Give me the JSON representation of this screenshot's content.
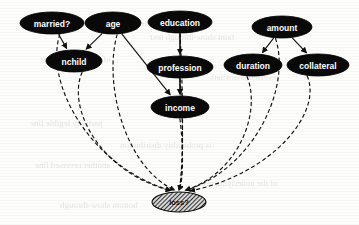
{
  "figure": {
    "type": "bayesian-network",
    "title_visible": false,
    "background": "#fdfdfb",
    "node_fill": "#090909",
    "node_text_color": "#ffffff",
    "target_node_fill": "hatched-gray",
    "edge_color": "#111111"
  },
  "nodes": [
    {
      "id": "married",
      "label": "married?",
      "cx": 52,
      "cy": 23,
      "rx": 32,
      "ry": 11,
      "style": "filled"
    },
    {
      "id": "age",
      "label": "age",
      "cx": 113,
      "cy": 23,
      "rx": 28,
      "ry": 11,
      "style": "filled"
    },
    {
      "id": "education",
      "label": "education",
      "cx": 180,
      "cy": 22,
      "rx": 32,
      "ry": 11,
      "style": "filled"
    },
    {
      "id": "amount",
      "label": "amount",
      "cx": 282,
      "cy": 27,
      "rx": 30,
      "ry": 11,
      "style": "filled"
    },
    {
      "id": "nchild",
      "label": "nchild",
      "cx": 74,
      "cy": 61,
      "rx": 28,
      "ry": 11,
      "style": "filled"
    },
    {
      "id": "profession",
      "label": "profession",
      "cx": 180,
      "cy": 67,
      "rx": 33,
      "ry": 11,
      "style": "filled"
    },
    {
      "id": "duration",
      "label": "duration",
      "cx": 253,
      "cy": 65,
      "rx": 29,
      "ry": 11,
      "style": "filled"
    },
    {
      "id": "collateral",
      "label": "collateral",
      "cx": 318,
      "cy": 65,
      "rx": 31,
      "ry": 11,
      "style": "filled"
    },
    {
      "id": "income",
      "label": "income",
      "cx": 180,
      "cy": 107,
      "rx": 29,
      "ry": 11,
      "style": "filled"
    },
    {
      "id": "loss",
      "label": "loss?",
      "cx": 179,
      "cy": 202,
      "rx": 27,
      "ry": 10,
      "style": "hatched"
    }
  ],
  "edges": [
    {
      "from": "married",
      "to": "nchild",
      "style": "solid"
    },
    {
      "from": "age",
      "to": "nchild",
      "style": "solid"
    },
    {
      "from": "age",
      "to": "income",
      "style": "solid"
    },
    {
      "from": "education",
      "to": "profession",
      "style": "solid"
    },
    {
      "from": "education",
      "to": "income",
      "style": "solid"
    },
    {
      "from": "profession",
      "to": "income",
      "style": "solid"
    },
    {
      "from": "amount",
      "to": "duration",
      "style": "solid"
    },
    {
      "from": "amount",
      "to": "collateral",
      "style": "solid"
    },
    {
      "from": "married",
      "to": "loss",
      "style": "dashed"
    },
    {
      "from": "nchild",
      "to": "loss",
      "style": "dashed"
    },
    {
      "from": "age",
      "to": "loss",
      "style": "dashed"
    },
    {
      "from": "education",
      "to": "loss",
      "style": "dashed"
    },
    {
      "from": "profession",
      "to": "loss",
      "style": "dashed"
    },
    {
      "from": "income",
      "to": "loss",
      "style": "dashed"
    },
    {
      "from": "duration",
      "to": "loss",
      "style": "dashed"
    },
    {
      "from": "amount",
      "to": "loss",
      "style": "dashed"
    },
    {
      "from": "collateral",
      "to": "loss",
      "style": "dashed"
    }
  ],
  "background_bleed": [
    {
      "text": "the reverse side of the scanned page",
      "x": 22,
      "y": 18,
      "size": 9
    },
    {
      "text": "faint show-through text",
      "x": 150,
      "y": 32,
      "size": 9
    },
    {
      "text": "of the printed paper",
      "x": 40,
      "y": 54,
      "size": 9
    },
    {
      "text": "reversed characters",
      "x": 210,
      "y": 72,
      "size": 9
    },
    {
      "text": "partially legible line",
      "x": 30,
      "y": 118,
      "size": 9
    },
    {
      "text": "is probability distribution",
      "x": 120,
      "y": 140,
      "size": 9
    },
    {
      "text": "another reversed line",
      "x": 35,
      "y": 160,
      "size": 9
    },
    {
      "text": "of the underlying text",
      "x": 200,
      "y": 178,
      "size": 9
    },
    {
      "text": "bottom show-through",
      "x": 60,
      "y": 200,
      "size": 9
    }
  ]
}
